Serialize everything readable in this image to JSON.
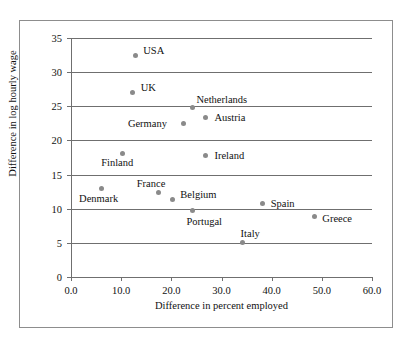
{
  "chart_data": {
    "type": "scatter",
    "title": "",
    "xlabel": "Difference in percent employed",
    "ylabel": "Difference in log hourly wage",
    "xlim": [
      0,
      60
    ],
    "ylim": [
      0,
      35
    ],
    "xticks": [
      "0.0",
      "10.0",
      "20.0",
      "30.0",
      "40.0",
      "50.0",
      "60.0"
    ],
    "xtick_values": [
      0,
      10,
      20,
      30,
      40,
      50,
      60
    ],
    "yticks": [
      "0",
      "5",
      "10",
      "15",
      "20",
      "25",
      "30",
      "35"
    ],
    "ytick_values": [
      0,
      5,
      10,
      15,
      20,
      25,
      30,
      35
    ],
    "grid": "horizontal",
    "legend": "none",
    "marker_color": "#8a8a8a",
    "axis_color": "#6f6f6f",
    "points": [
      {
        "label": "USA",
        "x": 12.8,
        "y": 32.4,
        "lx": 8,
        "ly": -11
      },
      {
        "label": "UK",
        "x": 12.3,
        "y": 27.0,
        "lx": 8,
        "ly": -11
      },
      {
        "label": "Netherlands",
        "x": 24.2,
        "y": 24.8,
        "lx": 4,
        "ly": -14
      },
      {
        "label": "Austria",
        "x": 26.8,
        "y": 23.4,
        "lx": 9,
        "ly": -5
      },
      {
        "label": "Germany",
        "x": 22.5,
        "y": 22.5,
        "lx": -56,
        "ly": -5
      },
      {
        "label": "Ireland",
        "x": 26.8,
        "y": 17.8,
        "lx": 9,
        "ly": -5
      },
      {
        "label": "Finland",
        "x": 10.2,
        "y": 18.1,
        "lx": -21,
        "ly": 4
      },
      {
        "label": "France",
        "x": 17.5,
        "y": 12.4,
        "lx": -22,
        "ly": -14
      },
      {
        "label": "Denmark",
        "x": 6.0,
        "y": 12.9,
        "lx": -22,
        "ly": 4
      },
      {
        "label": "Belgium",
        "x": 20.2,
        "y": 11.3,
        "lx": 8,
        "ly": -11
      },
      {
        "label": "Portugal",
        "x": 24.2,
        "y": 9.7,
        "lx": -6,
        "ly": 5
      },
      {
        "label": "Spain",
        "x": 38.2,
        "y": 10.8,
        "lx": 8,
        "ly": -5
      },
      {
        "label": "Greece",
        "x": 48.5,
        "y": 8.9,
        "lx": 8,
        "ly": -3
      },
      {
        "label": "Italy",
        "x": 34.2,
        "y": 5.1,
        "lx": -2,
        "ly": -14
      }
    ]
  }
}
